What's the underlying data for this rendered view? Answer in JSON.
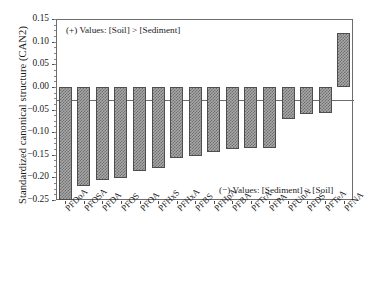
{
  "chart_data": {
    "type": "bar",
    "title": "",
    "xlabel": "",
    "ylabel": "Standardized canonical structure (CAN2)",
    "ylim": [
      -0.25,
      0.15
    ],
    "ytick_labels": [
      "0.15",
      "0.10",
      "0.05",
      "0.00",
      "-0.05",
      "-0.10",
      "-0.15",
      "-0.20",
      "-0.25"
    ],
    "ytick_values": [
      0.15,
      0.1,
      0.05,
      0.0,
      -0.05,
      -0.1,
      -0.15,
      -0.2,
      -0.25
    ],
    "grid": false,
    "legend": "none",
    "categories": [
      "PFDoA",
      "PFOSA",
      "PFDA",
      "PFOS",
      "PFOA",
      "PFHxS",
      "PFHxA",
      "PFBS",
      "PFHpA",
      "PFBA",
      "PFTrA",
      "PFPA",
      "PFUnA",
      "PFDS",
      "PFTeA",
      "PFNA"
    ],
    "values": [
      -0.249,
      -0.218,
      -0.206,
      -0.201,
      -0.185,
      -0.179,
      -0.157,
      -0.153,
      -0.143,
      -0.138,
      -0.134,
      -0.134,
      -0.072,
      -0.059,
      -0.058,
      0.118
    ],
    "annotations": [
      {
        "text": "(+) Values: [Soil] > [Sediment]",
        "position": "top-left"
      },
      {
        "text": "(−) Values: [Sediment] > [Soil]",
        "position": "bottom-right"
      }
    ],
    "bar_fill": "#a8a8a8",
    "bar_pattern": "checkered",
    "bar_edge_color": "#4e4e4e",
    "axis_color": "#6d6d6d"
  }
}
